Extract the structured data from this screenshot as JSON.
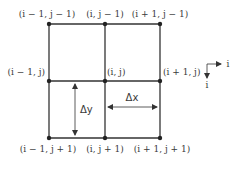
{
  "nodes": {
    "top_left": "(i − 1, j − 1)",
    "top_mid": "(i, j − 1)",
    "top_right": "(i + 1, j − 1)",
    "mid_left": "(i − 1, j)",
    "mid_mid": "(i, j)",
    "mid_right": "(i + 1, j)",
    "bot_left": "(i − 1, j + 1)",
    "bot_mid": "(i, j + 1)",
    "bot_right": "(i + 1, j + 1)"
  },
  "spacing": {
    "dy": "Δy",
    "dx": "Δx"
  },
  "axes": {
    "horizontal": "i",
    "vertical": "i"
  },
  "colors": {
    "line": "#333333",
    "text": "#3a3a3a"
  }
}
